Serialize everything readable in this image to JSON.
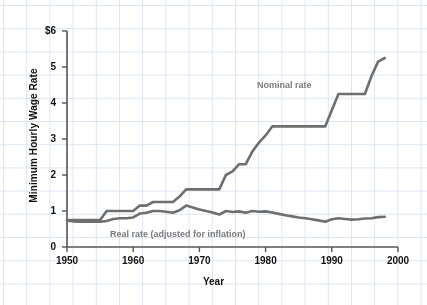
{
  "chart_data": {
    "type": "line",
    "title": "",
    "xlabel": "Year",
    "ylabel": "Minimum Hourly Wage Rate",
    "xlim": [
      1950,
      2000
    ],
    "ylim": [
      0,
      6
    ],
    "xticks": [
      "1950",
      "1960",
      "1970",
      "1980",
      "1990",
      "2000"
    ],
    "xtick_values": [
      1950,
      1960,
      1970,
      1980,
      1990,
      2000
    ],
    "yticks": [
      "0",
      "1",
      "2",
      "3",
      "4",
      "5",
      "$6"
    ],
    "ytick_values": [
      0,
      1,
      2,
      3,
      4,
      5,
      6
    ],
    "grid": true,
    "grid_color": "#dce6f0",
    "legend_position": "inline-annotations",
    "line_color": "#6e6e6e",
    "label_color": "#7a7a7a",
    "axis_color": "#555555",
    "background": "#ffffff",
    "series": [
      {
        "name": "Nominal rate",
        "color": "#6e6e6e",
        "x": [
          1950,
          1951,
          1952,
          1953,
          1954,
          1955,
          1956,
          1957,
          1958,
          1959,
          1960,
          1961,
          1962,
          1963,
          1964,
          1965,
          1966,
          1967,
          1968,
          1969,
          1970,
          1971,
          1972,
          1973,
          1974,
          1975,
          1976,
          1977,
          1978,
          1979,
          1980,
          1981,
          1982,
          1983,
          1984,
          1985,
          1986,
          1987,
          1988,
          1989,
          1990,
          1991,
          1992,
          1993,
          1994,
          1995,
          1996,
          1997,
          1998
        ],
        "values": [
          0.75,
          0.75,
          0.75,
          0.75,
          0.75,
          0.75,
          1.0,
          1.0,
          1.0,
          1.0,
          1.0,
          1.15,
          1.15,
          1.25,
          1.25,
          1.25,
          1.25,
          1.4,
          1.6,
          1.6,
          1.6,
          1.6,
          1.6,
          1.6,
          2.0,
          2.1,
          2.3,
          2.3,
          2.65,
          2.9,
          3.1,
          3.35,
          3.35,
          3.35,
          3.35,
          3.35,
          3.35,
          3.35,
          3.35,
          3.35,
          3.8,
          4.25,
          4.25,
          4.25,
          4.25,
          4.25,
          4.75,
          5.15,
          5.25
        ]
      },
      {
        "name": "Real rate (adjusted for inflation)",
        "color": "#6e6e6e",
        "x": [
          1950,
          1951,
          1952,
          1953,
          1954,
          1955,
          1956,
          1957,
          1958,
          1959,
          1960,
          1961,
          1962,
          1963,
          1964,
          1965,
          1966,
          1967,
          1968,
          1969,
          1970,
          1971,
          1972,
          1973,
          1974,
          1975,
          1976,
          1977,
          1978,
          1979,
          1980,
          1981,
          1982,
          1983,
          1984,
          1985,
          1986,
          1987,
          1988,
          1989,
          1990,
          1991,
          1992,
          1993,
          1994,
          1995,
          1996,
          1997,
          1998
        ],
        "values": [
          0.74,
          0.71,
          0.7,
          0.7,
          0.7,
          0.7,
          0.72,
          0.78,
          0.8,
          0.8,
          0.82,
          0.93,
          0.95,
          1.0,
          1.0,
          0.98,
          0.95,
          1.02,
          1.15,
          1.1,
          1.04,
          1.0,
          0.96,
          0.9,
          1.0,
          0.97,
          0.99,
          0.95,
          1.0,
          0.98,
          0.99,
          0.96,
          0.92,
          0.88,
          0.85,
          0.82,
          0.8,
          0.77,
          0.74,
          0.7,
          0.77,
          0.8,
          0.78,
          0.76,
          0.77,
          0.79,
          0.8,
          0.83,
          0.84
        ]
      }
    ],
    "annotations": [
      {
        "text": "Nominal rate",
        "x": 1981,
        "y": 4.6
      },
      {
        "text": "Real rate (adjusted for inflation)",
        "x": 1957,
        "y": 0.38
      }
    ]
  }
}
